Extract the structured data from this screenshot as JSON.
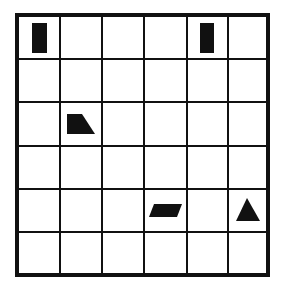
{
  "grid": {
    "rows": 6,
    "cols": 6,
    "outer": {
      "x": 15,
      "y": 13,
      "width": 255,
      "height": 264
    },
    "col_lines": [
      60,
      102,
      144,
      187,
      228
    ],
    "row_lines": [
      59,
      102,
      146,
      189,
      232
    ],
    "line_color": "#111111",
    "background": "#ffffff"
  },
  "shapes": [
    {
      "type": "rectangle",
      "row": 1,
      "col": 1,
      "points": "32,23 47,23 47,53 32,53",
      "color": "#111111"
    },
    {
      "type": "rectangle",
      "row": 1,
      "col": 5,
      "points": "200,23 214,23 214,53 200,53",
      "color": "#111111"
    },
    {
      "type": "trapezoid",
      "row": 3,
      "col": 2,
      "points": "67,114 82,114 95,134 67,134",
      "color": "#111111"
    },
    {
      "type": "parallelogram",
      "row": 5,
      "col": 4,
      "points": "154,204 182,204 177,217 149,217",
      "color": "#111111"
    },
    {
      "type": "triangle",
      "row": 5,
      "col": 6,
      "points": "247,198 260,221 236,221",
      "color": "#111111"
    }
  ]
}
